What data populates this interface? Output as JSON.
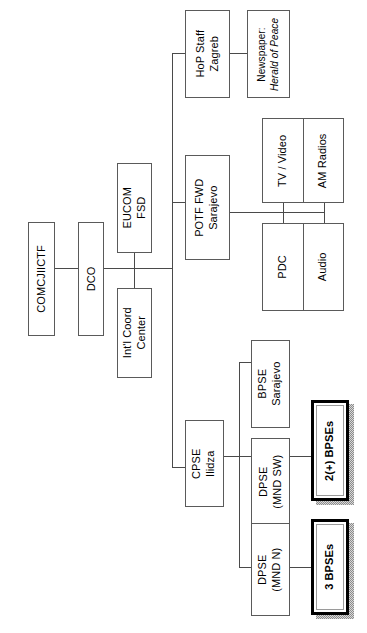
{
  "diagram": {
    "type": "organizational-chart",
    "orientation": "rotated-90-counterclockwise",
    "colors": {
      "box_border": "#5a5a5a",
      "line": "#4a4a4a",
      "emphasis_border": "#000000",
      "shadow": "#8c8c8c",
      "text": "#000000",
      "background": "#ffffff"
    }
  },
  "nodes": {
    "comcjiictf": {
      "label": "COMCJIICTF"
    },
    "dco": {
      "label": "DCO"
    },
    "eucom_fsd": {
      "line1": "EUCOM",
      "line2": "FSD"
    },
    "intl_coord_center": {
      "line1": "Int'l Coord",
      "line2": "Center"
    },
    "hop_staff_zagreb": {
      "line1": "HoP Staff",
      "line2": "Zagreb"
    },
    "newspaper": {
      "line1": "Newspaper:",
      "line2": "Herald of Peace"
    },
    "potf_fwd_sarajevo": {
      "line1": "POTF FWD",
      "line2": "Sarajevo"
    },
    "tv_video": {
      "label": "TV / Video"
    },
    "pdc": {
      "label": "PDC"
    },
    "am_radios": {
      "label": "AM Radios"
    },
    "audio": {
      "label": "Audio"
    },
    "cpse_ilidza": {
      "line1": "CPSE",
      "line2": "Ilidza"
    },
    "bpse_sarajevo": {
      "line1": "BPSE",
      "line2": "Sarajevo"
    },
    "dpse_mnd_sw": {
      "line1": "DPSE",
      "line2": "(MND SW)"
    },
    "bpses_2plus": {
      "label": "2(+) BPSEs"
    },
    "dpse_mnd_n": {
      "line1": "DPSE",
      "line2": "(MND N)"
    },
    "bpses_3": {
      "label": "3 BPSEs"
    }
  },
  "edges": [
    {
      "from": "comcjiictf",
      "to": "dco"
    },
    {
      "from": "dco",
      "to": "eucom_fsd"
    },
    {
      "from": "dco",
      "to": "intl_coord_center"
    },
    {
      "from": "dco",
      "to": "potf_fwd_sarajevo"
    },
    {
      "from": "potf_fwd_sarajevo",
      "to": "hop_staff_zagreb"
    },
    {
      "from": "hop_staff_zagreb",
      "to": "newspaper"
    },
    {
      "from": "potf_fwd_sarajevo",
      "to": "tv_video"
    },
    {
      "from": "potf_fwd_sarajevo",
      "to": "pdc"
    },
    {
      "from": "potf_fwd_sarajevo",
      "to": "am_radios"
    },
    {
      "from": "potf_fwd_sarajevo",
      "to": "audio"
    },
    {
      "from": "potf_fwd_sarajevo",
      "to": "cpse_ilidza"
    },
    {
      "from": "cpse_ilidza",
      "to": "bpse_sarajevo"
    },
    {
      "from": "cpse_ilidza",
      "to": "dpse_mnd_sw"
    },
    {
      "from": "cpse_ilidza",
      "to": "dpse_mnd_n"
    },
    {
      "from": "dpse_mnd_sw",
      "to": "bpses_2plus"
    },
    {
      "from": "dpse_mnd_n",
      "to": "bpses_3"
    }
  ]
}
